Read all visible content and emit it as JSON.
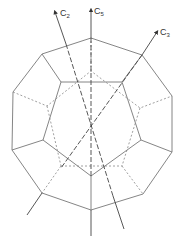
{
  "diagram": {
    "title": "",
    "axes": [
      {
        "id": "c2",
        "label": "C",
        "subscript": "2"
      },
      {
        "id": "c5",
        "label": "C",
        "subscript": "5"
      },
      {
        "id": "c3",
        "label": "C",
        "subscript": "3"
      }
    ],
    "colors": {
      "line": "#666666",
      "axis": "#444444",
      "text": "#333333"
    }
  }
}
